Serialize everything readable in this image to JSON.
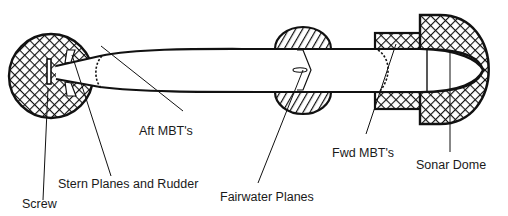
{
  "diagram": {
    "colors": {
      "stroke": "#111111",
      "background": "#ffffff",
      "text": "#1a1a1a"
    },
    "labels": {
      "aft_mbt": "Aft MBT's",
      "stern_planes": "Stern Planes and Rudder",
      "screw": "Screw",
      "fairwater_planes": "Fairwater Planes",
      "fwd_mbt": "Fwd MBT's",
      "sonar_dome": "Sonar Dome"
    },
    "components": [
      {
        "id": "screw",
        "fill": "solid-bar"
      },
      {
        "id": "stern-planes-rudder",
        "fill": "crosshatch"
      },
      {
        "id": "aft-mbt",
        "fill": "dashed-boundary"
      },
      {
        "id": "fairwater-planes",
        "fill": "diagonal-hatch"
      },
      {
        "id": "fwd-mbt",
        "fill": "crosshatch"
      },
      {
        "id": "sonar-dome",
        "fill": "crosshatch"
      }
    ]
  }
}
